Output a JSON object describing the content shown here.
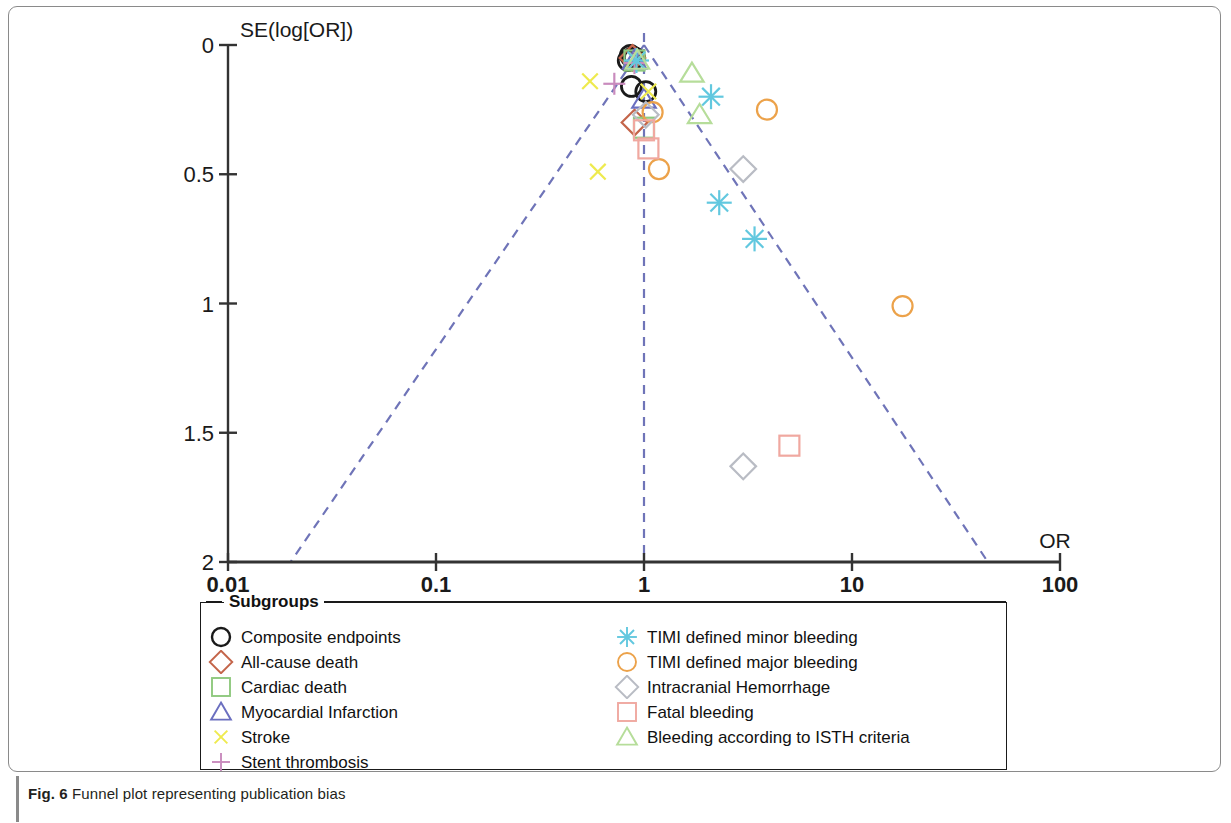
{
  "caption": {
    "lead": "Fig. 6",
    "text": " Funnel plot representing publication bias"
  },
  "legend": {
    "title": "Subgroups",
    "column_left": [
      {
        "label": "Composite endpoints",
        "marker": "circle",
        "color": "#1a1a1a"
      },
      {
        "label": "All-cause death",
        "marker": "diamond",
        "color": "#c4654a"
      },
      {
        "label": "Cardiac death",
        "marker": "square",
        "color": "#8fc97e"
      },
      {
        "label": "Myocardial Infarction",
        "marker": "triangle",
        "color": "#6b6fc0"
      },
      {
        "label": "Stroke",
        "marker": "cross",
        "color": "#eeea4e"
      },
      {
        "label": "Stent thrombosis",
        "marker": "plus",
        "color": "#c98bbd"
      }
    ],
    "column_right": [
      {
        "label": "TIMI defined minor bleeding",
        "marker": "asterisk",
        "color": "#62c8df"
      },
      {
        "label": "TIMI defined major bleeding",
        "marker": "circle",
        "color": "#eca24a"
      },
      {
        "label": "Intracranial Hemorrhage",
        "marker": "diamond",
        "color": "#b9bcc4"
      },
      {
        "label": "Fatal bleeding",
        "marker": "square",
        "color": "#f0a8a0"
      },
      {
        "label": "Bleeding according to ISTH criteria",
        "marker": "triangle",
        "color": "#b6dd9a"
      }
    ]
  },
  "chart_data": {
    "type": "scatter",
    "title": "Funnel plot representing publication bias",
    "xlabel": "OR",
    "ylabel": "SE(log[OR])",
    "xscale": "log",
    "xlim": [
      0.01,
      100
    ],
    "ylim": [
      0,
      2
    ],
    "y_inverted": true,
    "grid": false,
    "xticks": [
      "0.01",
      "0.1",
      "1",
      "10",
      "100"
    ],
    "xtick_values": [
      0.01,
      0.1,
      1,
      10,
      100
    ],
    "yticks": [
      "0",
      "0.5",
      "1",
      "1.5",
      "2"
    ],
    "ytick_values": [
      0,
      0.5,
      1,
      1.5,
      2
    ],
    "legend_position": "below-axes",
    "reference_line": {
      "x": 1,
      "style": "dashed",
      "color": "#6f74b8"
    },
    "funnel_lines": {
      "style": "dashed",
      "color": "#6f74b8",
      "apex": [
        1,
        0
      ],
      "left_base": [
        0.02,
        2
      ],
      "right_base": [
        45,
        2
      ]
    },
    "series": [
      {
        "name": "Composite endpoints",
        "marker": "circle",
        "color": "#1a1a1a",
        "points": [
          [
            0.86,
            0.04
          ],
          [
            0.88,
            0.05
          ],
          [
            0.9,
            0.05
          ],
          [
            0.84,
            0.06
          ],
          [
            0.87,
            0.16
          ],
          [
            1.02,
            0.18
          ]
        ]
      },
      {
        "name": "All-cause death",
        "marker": "diamond",
        "color": "#c4654a",
        "points": [
          [
            0.88,
            0.05
          ],
          [
            0.9,
            0.3
          ]
        ]
      },
      {
        "name": "Cardiac death",
        "marker": "square",
        "color": "#8fc97e",
        "points": [
          [
            0.9,
            0.06
          ],
          [
            1.0,
            0.32
          ]
        ]
      },
      {
        "name": "Myocardial Infarction",
        "marker": "triangle",
        "color": "#6b6fc0",
        "points": [
          [
            0.9,
            0.06
          ],
          [
            1.0,
            0.21
          ]
        ]
      },
      {
        "name": "Stroke",
        "marker": "cross",
        "color": "#eeea4e",
        "points": [
          [
            0.55,
            0.14
          ],
          [
            0.92,
            0.06
          ],
          [
            0.6,
            0.49
          ],
          [
            1.05,
            0.18
          ]
        ]
      },
      {
        "name": "Stent thrombosis",
        "marker": "plus",
        "color": "#c98bbd",
        "points": [
          [
            0.72,
            0.15
          ],
          [
            0.9,
            0.07
          ]
        ]
      },
      {
        "name": "TIMI defined minor bleeding",
        "marker": "asterisk",
        "color": "#62c8df",
        "points": [
          [
            2.1,
            0.2
          ],
          [
            2.3,
            0.61
          ],
          [
            3.4,
            0.75
          ],
          [
            0.92,
            0.06
          ]
        ]
      },
      {
        "name": "TIMI defined major bleeding",
        "marker": "circle",
        "color": "#eca24a",
        "points": [
          [
            3.9,
            0.25
          ],
          [
            1.18,
            0.48
          ],
          [
            1.1,
            0.26
          ],
          [
            17.5,
            1.01
          ]
        ]
      },
      {
        "name": "Intracranial Hemorrhage",
        "marker": "diamond",
        "color": "#b9bcc4",
        "points": [
          [
            1.02,
            0.27
          ],
          [
            3.0,
            0.48
          ],
          [
            3.0,
            1.63
          ]
        ]
      },
      {
        "name": "Fatal bleeding",
        "marker": "square",
        "color": "#f0a8a0",
        "points": [
          [
            1.0,
            0.33
          ],
          [
            1.05,
            0.4
          ],
          [
            5.0,
            1.55
          ]
        ]
      },
      {
        "name": "Bleeding according to ISTH criteria",
        "marker": "triangle",
        "color": "#b6dd9a",
        "points": [
          [
            1.7,
            0.11
          ],
          [
            1.85,
            0.27
          ],
          [
            0.93,
            0.06
          ]
        ]
      }
    ]
  }
}
